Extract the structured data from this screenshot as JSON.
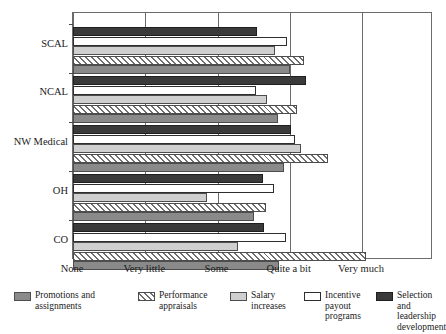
{
  "chart_data": {
    "type": "bar",
    "orientation": "horizontal",
    "title": "",
    "xlabel": "",
    "ylabel": "",
    "grid": true,
    "legend_position": "bottom",
    "xlim": [
      0,
      4
    ],
    "xtick_values": [
      0,
      1,
      2,
      3,
      4
    ],
    "xtick_labels": [
      "None",
      "Very little",
      "Some",
      "Quite a bit",
      "Very much"
    ],
    "categories": [
      "SCAL",
      "NCAL",
      "NW Medical",
      "OH",
      "CO"
    ],
    "series": [
      {
        "name": "Promotions and assignments",
        "swatch": "solid-medium-gray",
        "color": "#8a8a8a",
        "values": [
          3.0,
          2.84,
          2.92,
          2.5,
          2.85
        ]
      },
      {
        "name": "Performance appraisals",
        "swatch": "diagonal-hatch",
        "color": "#f2f2f2",
        "values": [
          3.2,
          3.1,
          3.53,
          2.67,
          4.06
        ]
      },
      {
        "name": "Salary increases",
        "swatch": "solid-light-gray",
        "color": "#cfcfcf",
        "values": [
          2.8,
          2.68,
          3.16,
          1.85,
          2.28
        ]
      },
      {
        "name": "Incentive payout programs",
        "swatch": "white-outline",
        "color": "#ffffff",
        "values": [
          2.96,
          2.53,
          3.07,
          2.78,
          2.95
        ]
      },
      {
        "name": "Selection and leadership development",
        "swatch": "solid-dark",
        "color": "#3a3a3a",
        "values": [
          2.55,
          3.22,
          3.02,
          2.63,
          2.64
        ]
      }
    ]
  },
  "legend": {
    "items": [
      "Promotions and\nassignments",
      "Performance\nappraisals",
      "Salary\nincreases",
      "Incentive\npayout\nprograms",
      "Selection and\nleadership\ndevelopment"
    ]
  }
}
